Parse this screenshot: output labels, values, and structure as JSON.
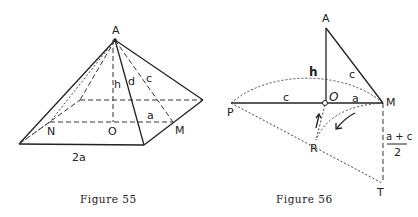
{
  "figure55": {
    "caption": "Figure 55",
    "labels": {
      "apex": "A",
      "height": "h",
      "edge": "d",
      "slant": "c",
      "half_base": "a",
      "left_mid": "N",
      "center": "O",
      "right_mid": "M",
      "base_side": "2a"
    }
  },
  "figure56": {
    "caption": "Figure 56",
    "labels": {
      "apex": "A",
      "height": "h",
      "hypotenuse": "c",
      "left_segment": "c",
      "center": "O",
      "right_segment": "a",
      "right_point": "M",
      "left_point": "P",
      "lower_point": "R",
      "bottom_point": "T",
      "fraction_numerator": "a + c",
      "fraction_denominator": "2"
    }
  }
}
